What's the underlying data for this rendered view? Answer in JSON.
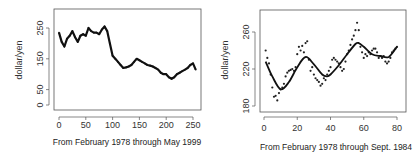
{
  "chart_data": [
    {
      "type": "line",
      "panel": "left",
      "title": "",
      "xlabel": "From February 1978 through May 1999",
      "ylabel": "dollar/yen",
      "xlim": [
        0,
        260
      ],
      "ylim": [
        0,
        300
      ],
      "xticks": [
        0,
        50,
        100,
        150,
        200,
        250
      ],
      "yticks": [
        0,
        50,
        150,
        250
      ],
      "ytick_labels": [
        "0",
        "50",
        "150",
        "250"
      ],
      "grid": false,
      "series": [
        {
          "name": "observed (points with smoothed line)",
          "x": [
            0,
            5,
            10,
            15,
            20,
            25,
            30,
            35,
            40,
            45,
            50,
            55,
            60,
            65,
            70,
            75,
            80,
            85,
            90,
            95,
            100,
            105,
            110,
            115,
            120,
            125,
            130,
            135,
            140,
            145,
            150,
            155,
            160,
            165,
            170,
            175,
            180,
            185,
            190,
            195,
            200,
            205,
            210,
            215,
            220,
            225,
            230,
            235,
            240,
            245,
            250,
            255
          ],
          "y": [
            235,
            205,
            190,
            215,
            225,
            240,
            220,
            205,
            225,
            230,
            225,
            250,
            240,
            235,
            235,
            230,
            245,
            255,
            240,
            200,
            160,
            150,
            140,
            130,
            120,
            122,
            125,
            130,
            140,
            150,
            145,
            140,
            135,
            130,
            128,
            125,
            120,
            115,
            105,
            100,
            100,
            90,
            85,
            90,
            100,
            105,
            110,
            115,
            120,
            130,
            135,
            115
          ]
        }
      ]
    },
    {
      "type": "scatter",
      "panel": "right",
      "title": "",
      "xlabel": "From February 1978 through Sept. 1984",
      "ylabel": "dollar/yen",
      "xlim": [
        0,
        80
      ],
      "ylim": [
        180,
        272
      ],
      "xticks": [
        0,
        20,
        40,
        60,
        80
      ],
      "yticks": [
        180,
        220,
        260
      ],
      "grid": false,
      "series": [
        {
          "name": "observed points",
          "x": [
            1,
            2,
            3,
            4,
            5,
            6,
            7,
            8,
            9,
            10,
            11,
            12,
            13,
            14,
            15,
            16,
            17,
            18,
            19,
            20,
            21,
            22,
            23,
            24,
            25,
            26,
            27,
            28,
            29,
            30,
            31,
            32,
            33,
            34,
            35,
            36,
            37,
            38,
            39,
            40,
            41,
            42,
            43,
            44,
            45,
            46,
            47,
            48,
            49,
            50,
            51,
            52,
            53,
            54,
            55,
            56,
            57,
            58,
            59,
            60,
            61,
            62,
            63,
            64,
            65,
            66,
            67,
            68,
            69,
            70,
            71,
            72,
            73,
            74,
            75,
            76,
            77,
            78,
            79,
            80
          ],
          "y": [
            240,
            232,
            226,
            214,
            200,
            190,
            191,
            186,
            194,
            198,
            200,
            204,
            212,
            216,
            218,
            219,
            220,
            218,
            222,
            236,
            244,
            240,
            245,
            238,
            248,
            250,
            230,
            218,
            222,
            214,
            210,
            208,
            206,
            202,
            204,
            210,
            208,
            214,
            218,
            222,
            230,
            232,
            230,
            228,
            226,
            222,
            218,
            220,
            228,
            236,
            240,
            246,
            252,
            256,
            262,
            270,
            262,
            244,
            238,
            232,
            236,
            234,
            238,
            236,
            240,
            242,
            242,
            238,
            232,
            234,
            232,
            234,
            228,
            226,
            228,
            232,
            238,
            240,
            242,
            244
          ]
        },
        {
          "name": "smoothed fit",
          "x": [
            1,
            5,
            10,
            15,
            20,
            25,
            30,
            35,
            38,
            40,
            45,
            50,
            55,
            57,
            60,
            65,
            70,
            75,
            80
          ],
          "y": [
            228,
            212,
            198,
            206,
            222,
            233,
            225,
            214,
            212,
            214,
            224,
            236,
            247,
            248,
            244,
            236,
            234,
            233,
            244
          ]
        }
      ]
    }
  ],
  "panels": {
    "left": {
      "ylabel": "dollar/yen",
      "caption": "From February 1978 through May 1999",
      "xtick_labels": [
        "0",
        "50",
        "100",
        "150",
        "200",
        "250"
      ],
      "ytick_labels": [
        "0",
        "50",
        "150",
        "250"
      ]
    },
    "right": {
      "ylabel": "dollar/yen",
      "caption": "From February 1978 through Sept. 1984",
      "xtick_labels": [
        "0",
        "20",
        "40",
        "60",
        "80"
      ],
      "ytick_labels": [
        "180",
        "220",
        "260"
      ]
    }
  }
}
